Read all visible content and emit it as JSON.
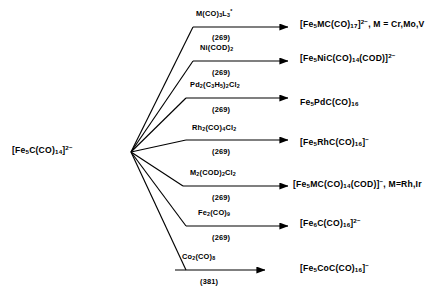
{
  "diagram": {
    "reactant": {
      "formula_html": "[Fe<sub>5</sub>C(CO)<sub>14</sub>]<sup>2−</sup>",
      "plain": "[Fe5C(CO)14]2-"
    },
    "reactions": [
      {
        "id": "reaction-1",
        "reagent_html": "M(CO)<sub>3</sub>L<sub>3</sub><sup>*</sup>",
        "reagent_plain": "M(CO)3L3*",
        "ref": "(269)",
        "product_html": "[Fe<sub>5</sub>MC(CO)<sub>17</sub>]<sup>2−</sup>, M = Cr,Mo,V",
        "product_plain": "[Fe5MC(CO)17]2-, M = Cr,Mo,V"
      },
      {
        "id": "reaction-2",
        "reagent_html": "Ni(COD)<sub>2</sub>",
        "reagent_plain": "Ni(COD)2",
        "ref": "(269)",
        "product_html": "[Fe<sub>5</sub>NiC(CO)<sub>14</sub>(COD)]<sup>2−</sup>",
        "product_plain": "[Fe5NiC(CO)14(COD)]2-"
      },
      {
        "id": "reaction-3",
        "reagent_html": "Pd<sub>2</sub>(C<sub>3</sub>H<sub>5</sub>)<sub>2</sub>Cl<sub>2</sub>",
        "reagent_plain": "Pd2(C3H5)2Cl2",
        "ref": "(269)",
        "product_html": "Fe<sub>5</sub>PdC(CO)<sub>16</sub>",
        "product_plain": "Fe5PdC(CO)16"
      },
      {
        "id": "reaction-4",
        "reagent_html": "Rh<sub>2</sub>(CO)<sub>4</sub>Cl<sub>2</sub>",
        "reagent_plain": "Rh2(CO)4Cl2",
        "ref": "(269)",
        "product_html": "[Fe<sub>5</sub>RhC(CO)<sub>16</sub>]<sup>−</sup>",
        "product_plain": "[Fe5RhC(CO)16]-"
      },
      {
        "id": "reaction-5",
        "reagent_html": "M<sub>2</sub>(COD)<sub>2</sub>Cl<sub>2</sub>",
        "reagent_plain": "M2(COD)2Cl2",
        "ref": "(269)",
        "product_html": "[Fe<sub>5</sub>MC(CO)<sub>14</sub>(COD)]<sup>−</sup>, M=Rh,Ir",
        "product_plain": "[Fe5MC(CO)14(COD)]-, M=Rh,Ir"
      },
      {
        "id": "reaction-6",
        "reagent_html": "Fe<sub>2</sub>(CO)<sub>9</sub>",
        "reagent_plain": "Fe2(CO)9",
        "ref": "(269)",
        "product_html": "[Fe<sub>6</sub>C(CO)<sub>16</sub>]<sup>2−</sup>",
        "product_plain": "[Fe6C(CO)16]2-"
      },
      {
        "id": "reaction-7",
        "reagent_html": "Co<sub>2</sub>(CO)<sub>8</sub>",
        "reagent_plain": "Co2(CO)8",
        "ref": "(381)",
        "product_html": "[Fe<sub>5</sub>CoC(CO)<sub>16</sub>]<sup>−</sup>",
        "product_plain": "[Fe5CoC(CO)16]-"
      }
    ]
  }
}
